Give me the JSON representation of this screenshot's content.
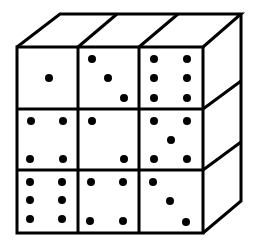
{
  "figure": {
    "line_color": "#000000",
    "background": "#ffffff",
    "front_faces": [
      {
        "row": 1,
        "col": 1,
        "pips": 1,
        "dots": [
          [
            49,
            78
          ]
        ]
      },
      {
        "row": 1,
        "col": 2,
        "pips": 3,
        "dots": [
          [
            92,
            59
          ],
          [
            108,
            78
          ],
          [
            124,
            98
          ]
        ]
      },
      {
        "row": 1,
        "col": 3,
        "pips": 6,
        "dots": [
          [
            154,
            59
          ],
          [
            187,
            59
          ],
          [
            154,
            78
          ],
          [
            187,
            78
          ],
          [
            154,
            98
          ],
          [
            187,
            98
          ]
        ]
      },
      {
        "row": 2,
        "col": 1,
        "pips": 4,
        "dots": [
          [
            31,
            121
          ],
          [
            63,
            121
          ],
          [
            30,
            159
          ],
          [
            63,
            159
          ]
        ]
      },
      {
        "row": 2,
        "col": 2,
        "pips": 2,
        "dots": [
          [
            92,
            121
          ],
          [
            124,
            159
          ]
        ]
      },
      {
        "row": 2,
        "col": 3,
        "pips": 5,
        "dots": [
          [
            154,
            121
          ],
          [
            187,
            121
          ],
          [
            171,
            140
          ],
          [
            154,
            159
          ],
          [
            187,
            159
          ]
        ]
      },
      {
        "row": 3,
        "col": 1,
        "pips": 6,
        "dots": [
          [
            30,
            182
          ],
          [
            62,
            182
          ],
          [
            30,
            200
          ],
          [
            62,
            200
          ],
          [
            30,
            219
          ],
          [
            62,
            219
          ]
        ]
      },
      {
        "row": 3,
        "col": 2,
        "pips": 4,
        "dots": [
          [
            91,
            182
          ],
          [
            123,
            182
          ],
          [
            90,
            221
          ],
          [
            123,
            221
          ]
        ]
      },
      {
        "row": 3,
        "col": 3,
        "pips": 3,
        "dots": [
          [
            153,
            182
          ],
          [
            170,
            201
          ],
          [
            186,
            222
          ]
        ]
      }
    ]
  }
}
